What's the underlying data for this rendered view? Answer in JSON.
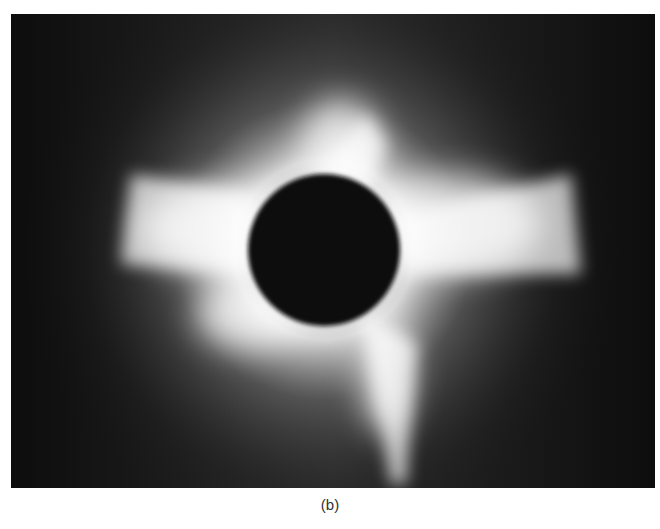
{
  "figure": {
    "caption": "(b)",
    "colors": {
      "background": "#141414",
      "corona": "#ffffff",
      "moon_disk": "#111111",
      "page": "#ffffff"
    }
  }
}
